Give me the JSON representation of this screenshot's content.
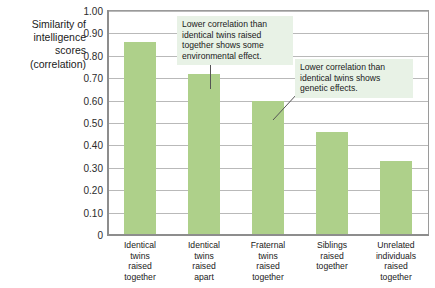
{
  "chart_data": {
    "type": "bar",
    "title": "",
    "subtitle": "",
    "xlabel": "",
    "ylabel": "Similarity of intelligence scores (correlation)",
    "ylabel_lines": [
      "Similarity of",
      "intelligence",
      "scores",
      "(correlation)"
    ],
    "categories": [
      "Identical twins raised together",
      "Identical twins raised apart",
      "Fraternal twins raised together",
      "Siblings raised together",
      "Unrelated individuals raised together"
    ],
    "category_lines": [
      [
        "Identical",
        "twins",
        "raised",
        "together"
      ],
      [
        "Identical",
        "twins",
        "raised",
        "apart"
      ],
      [
        "Fraternal",
        "twins",
        "raised",
        "together"
      ],
      [
        "Siblings",
        "raised",
        "together"
      ],
      [
        "Unrelated",
        "individuals",
        "raised",
        "together"
      ]
    ],
    "values": [
      0.86,
      0.72,
      0.6,
      0.46,
      0.33
    ],
    "ylim": [
      0,
      1.0
    ],
    "ytick_values": [
      1.0,
      0.9,
      0.8,
      0.7,
      0.6,
      0.5,
      0.4,
      0.3,
      0.2,
      0.1,
      0
    ],
    "ytick_labels": [
      "1.00",
      "0.90",
      "0.80",
      "0.70",
      "0.60",
      "0.50",
      "0.40",
      "0.30",
      "0.20",
      "0.10",
      "0"
    ],
    "grid": true,
    "legend": "none",
    "bar_color": "#aed08a",
    "gridline_color": "#b9b9b9",
    "frame_color": "#9a9a9a",
    "annotations": [
      {
        "id": "annotation-1",
        "text": "Lower correlation than identical twins raised together shows some environmental effect.",
        "lines": [
          "Lower correlation than",
          "identical twins raised",
          "together shows some",
          "environmental effect."
        ],
        "points_to": "Identical twins raised apart",
        "background": "#e8f2e6"
      },
      {
        "id": "annotation-2",
        "text": "Lower correlation than identical twins shows genetic effects.",
        "lines": [
          "Lower correlation than",
          "identical twins shows",
          "genetic effects."
        ],
        "points_to": "Fraternal twins raised together",
        "background": "#e8f2e6"
      }
    ]
  }
}
